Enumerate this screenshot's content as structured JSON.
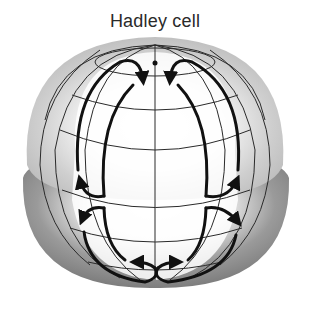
{
  "title": "Hadley cell",
  "colors": {
    "background": "#ffffff",
    "shade_dark": "#6e6e6e",
    "shade_light": "#e8e8e8",
    "grid_line": "#2a2a2a",
    "flow_arrow": "#111111",
    "title_text": "#2a2a2a"
  },
  "diagram": {
    "gridlines": {
      "meridians": 7,
      "parallels": 6
    },
    "circulation_cells": [
      {
        "side": "left",
        "hemisphere": "upper",
        "description": "poleward flow along outer edge, returning down inner edge toward mid-latitude"
      },
      {
        "side": "right",
        "hemisphere": "upper",
        "description": "poleward flow along outer edge, returning down inner edge toward mid-latitude"
      },
      {
        "side": "left",
        "hemisphere": "lower",
        "description": "loop from mid-latitude down to base convergence"
      },
      {
        "side": "right",
        "hemisphere": "lower",
        "description": "loop from mid-latitude down to base convergence"
      }
    ]
  }
}
